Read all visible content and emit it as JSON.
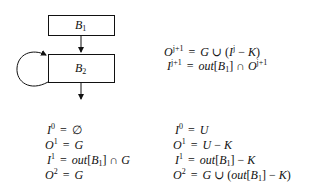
{
  "diagram": {
    "blocks": [
      {
        "id": "B1",
        "label": "B",
        "subscript": "1"
      },
      {
        "id": "B2",
        "label": "B",
        "subscript": "2",
        "self_loop": true
      }
    ],
    "edges": [
      {
        "from": "B1",
        "to": "B2"
      },
      {
        "from": "B2",
        "to": "B2"
      },
      {
        "from": "B2",
        "to": "exit"
      }
    ]
  },
  "recurrence": {
    "lines": [
      {
        "lhs": "O",
        "lhs_sup": "j+1",
        "rhs": "G ∪ (I^j − K)"
      },
      {
        "lhs": "I",
        "lhs_sup": "j+1",
        "rhs": "out[B_1] ∩ O^{j+1}"
      }
    ]
  },
  "left_column": {
    "lines": [
      {
        "lhs": "I",
        "lhs_sup": "0",
        "rhs": "∅"
      },
      {
        "lhs": "O",
        "lhs_sup": "1",
        "rhs": "G"
      },
      {
        "lhs": "I",
        "lhs_sup": "1",
        "rhs": "out[B_1] ∩ G"
      },
      {
        "lhs": "O",
        "lhs_sup": "2",
        "rhs": "G"
      }
    ]
  },
  "right_column": {
    "lines": [
      {
        "lhs": "I",
        "lhs_sup": "0",
        "rhs": "U"
      },
      {
        "lhs": "O",
        "lhs_sup": "1",
        "rhs": "U − K"
      },
      {
        "lhs": "I",
        "lhs_sup": "1",
        "rhs": "out[B_1] − K"
      },
      {
        "lhs": "O",
        "lhs_sup": "2",
        "rhs": "G ∪ (out[B_1] − K)"
      }
    ]
  },
  "text": {
    "eq": "=",
    "b": "B",
    "one": "1",
    "two": "2",
    "O": "O",
    "I": "I",
    "G": "G",
    "U": "U",
    "K": "K",
    "out": "out",
    "cup": "∪",
    "cap": "∩",
    "minus": "−",
    "empty": "∅",
    "lbr": "[",
    "rbr": "]",
    "lp": "(",
    "rp": ")",
    "j": "j",
    "jp1": "j+1",
    "zero": "0"
  }
}
